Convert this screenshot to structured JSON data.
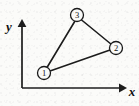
{
  "figure": {
    "kind": "geometry-diagram",
    "background_color": "#fbfbf9",
    "ink_color": "#1a1a1a"
  },
  "axes": {
    "origin": {
      "x": 22,
      "y": 88
    },
    "x_axis": {
      "label": "x",
      "from": {
        "x": 22,
        "y": 88
      },
      "to": {
        "x": 125,
        "y": 88
      },
      "arrow": "right",
      "label_pos": {
        "x": 132,
        "y": 91
      }
    },
    "y_axis": {
      "label": "y",
      "from": {
        "x": 22,
        "y": 88
      },
      "to": {
        "x": 22,
        "y": 21
      },
      "arrow": "up",
      "label_pos": {
        "x": 9,
        "y": 26
      }
    }
  },
  "nodes": [
    {
      "id": "node-1",
      "label": "1",
      "cx": 44,
      "cy": 73,
      "r": 6.5
    },
    {
      "id": "node-2",
      "label": "2",
      "cx": 116,
      "cy": 48,
      "r": 6.5
    },
    {
      "id": "node-3",
      "label": "3",
      "cx": 77,
      "cy": 15,
      "r": 6.5
    }
  ],
  "edges": [
    {
      "id": "edge-1-3",
      "from": "node-1",
      "to": "node-3",
      "x1": 47,
      "y1": 67,
      "x2": 75,
      "y2": 21
    },
    {
      "id": "edge-3-2",
      "from": "node-3",
      "to": "node-2",
      "x1": 81,
      "y1": 19,
      "x2": 111,
      "y2": 44
    },
    {
      "id": "edge-1-2",
      "from": "node-1",
      "to": "node-2",
      "x1": 50,
      "y1": 71,
      "x2": 110,
      "y2": 50
    }
  ]
}
